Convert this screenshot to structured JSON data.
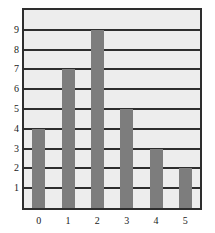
{
  "chart_data": {
    "type": "bar",
    "title": "",
    "subtitle": "",
    "xlabel": "",
    "ylabel": "",
    "categories": [
      "0",
      "1",
      "2",
      "3",
      "4",
      "5"
    ],
    "values": [
      4,
      7,
      9,
      5,
      3,
      2
    ],
    "series": [
      {
        "name": "count",
        "values": [
          4,
          7,
          9,
          5,
          3,
          2
        ]
      }
    ],
    "x_tick_labels": [
      "0",
      "1",
      "2",
      "3",
      "4",
      "5"
    ],
    "y_tick_labels": [
      "1",
      "2",
      "3",
      "4",
      "5",
      "6",
      "7",
      "8",
      "9"
    ],
    "y_tick_values": [
      1,
      2,
      3,
      4,
      5,
      6,
      7,
      8,
      9
    ],
    "ylim": [
      0,
      10
    ],
    "xlim": [
      -0.5,
      5.5
    ],
    "grid": true,
    "grid_orientation": "horizontal",
    "legend": false,
    "legend_position": "none",
    "annotations": [],
    "colors": {
      "bar": "#7d7d7d",
      "plot_background": "#ededed",
      "grid": "#2e2e2e",
      "axis": "#2e2e2e",
      "tick_label": "#1a1a1a",
      "page_background": "#ffffff"
    }
  }
}
